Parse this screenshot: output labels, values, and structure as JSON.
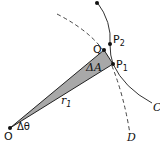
{
  "diagram": {
    "labels": {
      "origin": "O",
      "q": "Q",
      "p2": "P",
      "p2_sub": "2",
      "p1": "P",
      "p1_sub": "1",
      "delta_a": "ΔA",
      "r1": "r",
      "r1_sub": "1",
      "delta_theta": "Δθ",
      "curve_c": "C",
      "curve_d": "D"
    },
    "colors": {
      "wedge_fill": "#a8a8a8",
      "stroke": "#222222"
    }
  }
}
